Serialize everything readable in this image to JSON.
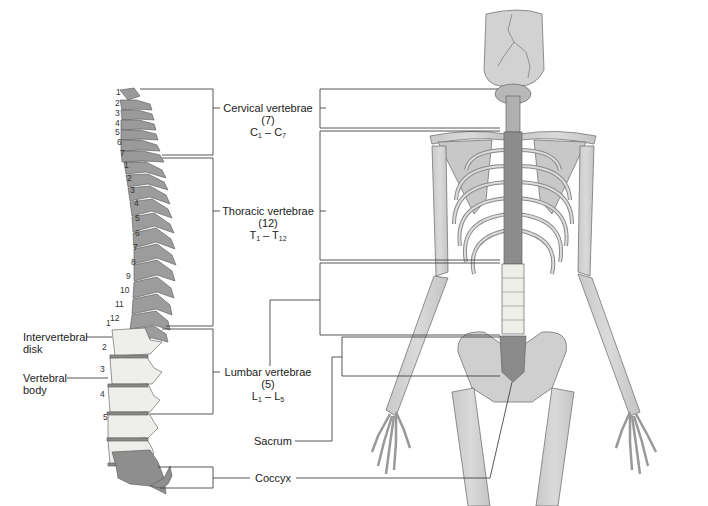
{
  "figure": {
    "colors": {
      "bone_light": "#d3d3d3",
      "bone_mid": "#b8b8b8",
      "bone_dark": "#8a8a8a",
      "lumbar_pale": "#eeeeea",
      "outline": "#555555",
      "leader_line": "#444444",
      "background": "#ffffff"
    }
  },
  "regions": [
    {
      "name": "Cervical vertebrae",
      "count": "(7)",
      "range_prefix": "C",
      "range_start": "1",
      "range_end": "7",
      "numbers": [
        "1",
        "2",
        "3",
        "4",
        "5",
        "6",
        "7"
      ]
    },
    {
      "name": "Thoracic vertebrae",
      "count": "(12)",
      "range_prefix": "T",
      "range_start": "1",
      "range_end": "12",
      "numbers": [
        "1",
        "2",
        "3",
        "4",
        "5",
        "6",
        "7",
        "8",
        "9",
        "10",
        "11",
        "12"
      ]
    },
    {
      "name": "Lumbar vertebrae",
      "count": "(5)",
      "range_prefix": "L",
      "range_start": "1",
      "range_end": "5",
      "numbers": [
        "1",
        "2",
        "3",
        "4",
        "5"
      ]
    },
    {
      "name": "Sacrum"
    },
    {
      "name": "Coccyx"
    }
  ],
  "side_labels": {
    "intervertebral_line1": "Intervertebral",
    "intervertebral_line2": "disk",
    "vertebral_line1": "Vertebral",
    "vertebral_line2": "body"
  },
  "dash": "–"
}
